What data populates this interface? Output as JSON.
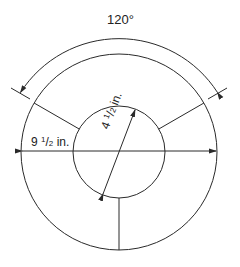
{
  "diagram": {
    "angle_label": "120°",
    "outer_diameter": {
      "whole": "9",
      "num": "1",
      "den": "2",
      "unit": "in."
    },
    "inner_diameter": {
      "whole": "4",
      "num": "1",
      "den": "2",
      "unit": "in."
    },
    "segments": 3,
    "colors": {
      "stroke": "#2a2a2a",
      "background": "#ffffff"
    }
  }
}
